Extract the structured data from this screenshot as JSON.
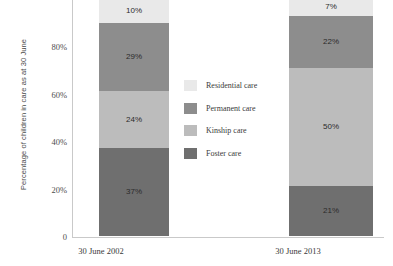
{
  "chart_data": {
    "type": "bar",
    "stacked": true,
    "normalized": true,
    "title": "",
    "subtitle": "",
    "xlabel": "",
    "ylabel": "Percentage of children in care as at 30 June",
    "categories": [
      "30 June 2002",
      "30 June 2013"
    ],
    "ylim": [
      0,
      100
    ],
    "ytick_labels": [
      "0",
      "20%",
      "40%",
      "60%",
      "80%"
    ],
    "ytick_values": [
      0,
      20,
      40,
      60,
      80
    ],
    "grid": false,
    "legend_position": "right-inside",
    "series": [
      {
        "name": "Residential care",
        "color": "#e9e9e9",
        "values": [
          10,
          7
        ],
        "labels": [
          "10%",
          "7%"
        ]
      },
      {
        "name": "Permanent care",
        "color": "#8d8d8d",
        "values": [
          29,
          22
        ],
        "labels": [
          "29%",
          "22%"
        ]
      },
      {
        "name": "Kinship care",
        "color": "#bcbcbc",
        "values": [
          24,
          50
        ],
        "labels": [
          "24%",
          "50%"
        ]
      },
      {
        "name": "Foster care",
        "color": "#6f6f6f",
        "values": [
          37,
          21
        ],
        "labels": [
          "37%",
          "21%"
        ]
      }
    ]
  },
  "legend": {
    "items": [
      {
        "label": "Residential care",
        "color": "#e9e9e9"
      },
      {
        "label": "Permanent care",
        "color": "#8d8d8d"
      },
      {
        "label": "Kinship care",
        "color": "#bcbcbc"
      },
      {
        "label": "Foster care",
        "color": "#6f6f6f"
      }
    ]
  }
}
